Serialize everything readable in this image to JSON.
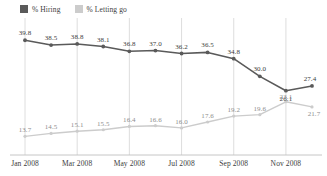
{
  "legend": {
    "entries": [
      {
        "label": "% Hiring",
        "color": "#5a5a5a",
        "icon": "square-swatch-icon"
      },
      {
        "label": "% Letting go",
        "color": "#cccccc",
        "icon": "square-swatch-icon"
      }
    ]
  },
  "axis": {
    "tick_labels": [
      "Jan 2008",
      "Mar 2008",
      "May 2008",
      "Jul 2008",
      "Sep 2008",
      "Nov 2008"
    ]
  },
  "chart_data": {
    "type": "line",
    "title": "",
    "subtitle": "",
    "xlabel": "",
    "ylabel": "",
    "grid": "vertical-only",
    "legend_position": "top-left",
    "ylim": [
      0,
      45
    ],
    "x": [
      "Jan 2008",
      "Feb 2008",
      "Mar 2008",
      "Apr 2008",
      "May 2008",
      "Jun 2008",
      "Jul 2008",
      "Aug 2008",
      "Sep 2008",
      "Oct 2008",
      "Nov 2008",
      "Dec 2008"
    ],
    "tick_labels": [
      "Jan 2008",
      "Mar 2008",
      "May 2008",
      "Jul 2008",
      "Sep 2008",
      "Nov 2008"
    ],
    "tick_indices": [
      0,
      2,
      4,
      6,
      8,
      10
    ],
    "series": [
      {
        "name": "% Hiring",
        "color": "#5a5a5a",
        "values": [
          39.8,
          38.5,
          38.8,
          38.1,
          36.8,
          37.0,
          36.2,
          36.5,
          34.8,
          30.0,
          26.1,
          27.4
        ],
        "labels": [
          "39.8",
          "38.5",
          "38.8",
          "38.1",
          "36.8",
          "37.0",
          "36.2",
          "36.5",
          "34.8",
          "30.0",
          "26.1",
          "27.4"
        ]
      },
      {
        "name": "% Letting go",
        "color": "#cccccc",
        "values": [
          13.7,
          14.5,
          15.1,
          15.5,
          16.4,
          16.6,
          16.0,
          17.6,
          19.2,
          19.6,
          23.1,
          21.7
        ],
        "labels": [
          "13.7",
          "14.5",
          "15.1",
          "15.5",
          "16.4",
          "16.6",
          "16.0",
          "17.6",
          "19.2",
          "19.6",
          "23.1",
          "21.7"
        ]
      }
    ]
  }
}
